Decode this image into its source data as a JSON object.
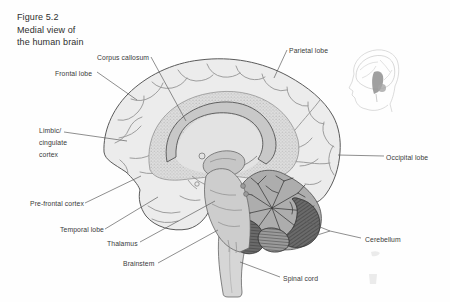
{
  "figure": {
    "title_lines": [
      "Figure 5.2",
      "Medial view of",
      "the human brain"
    ]
  },
  "labels": {
    "corpus_callosum": "Corpus callosum",
    "parietal_lobe": "Parietal lobe",
    "frontal_lobe": "Frontal lobe",
    "limbic_lines": [
      "Limbic/",
      "cingulate",
      "cortex"
    ],
    "occipital_lobe": "Occipital lobe",
    "prefrontal_cortex": "Pre-frontal cortex",
    "temporal_lobe": "Temporal lobe",
    "thalamus": "Thalamus",
    "brainstem": "Brainstem",
    "cerebellum": "Cerebellum",
    "spinal_cord": "Spinal cord"
  },
  "colors": {
    "background": "#fefefe",
    "cortex_fill": "#ececec",
    "cortex_outline": "#5a5a5a",
    "stipple_base": "#dedede",
    "stipple_dot": "#a6a6a6",
    "inner_medial_fill": "#e3e3e3",
    "corpus_callosum_fill": "#c8c8c8",
    "thalamus_fill": "#c6c6c6",
    "brainstem_fill": "#cdcdcd",
    "cerebellum_fill": "#adadad",
    "cerebellum_dark": "#6a6a6a",
    "cerebellum_mid": "#9a9a9a",
    "spinal_cord_fill": "#d6d6d6",
    "leader_line": "#5f5f5f",
    "label_text": "#3a3a3a"
  }
}
